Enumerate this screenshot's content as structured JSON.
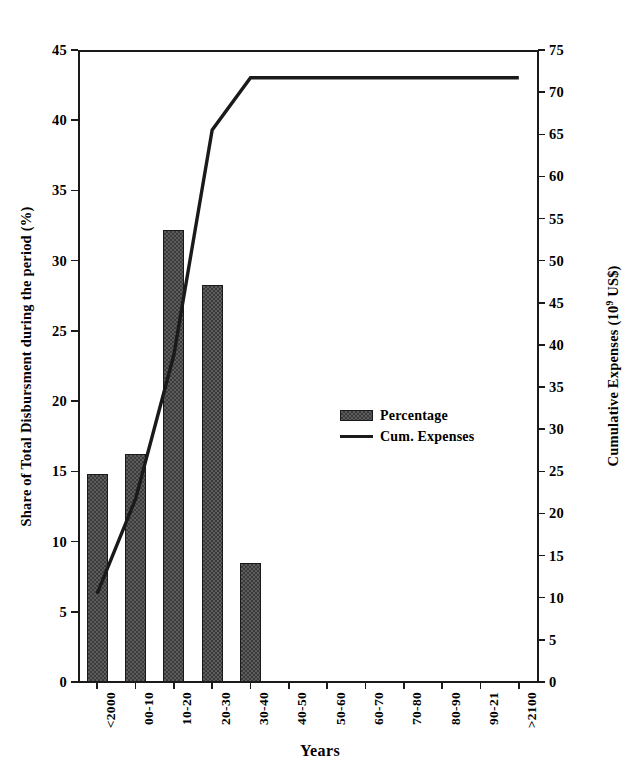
{
  "chart_data": {
    "type": "bar",
    "title": "",
    "xlabel": "Years",
    "ylabel": "Share of Total Disbursment during the period (%)",
    "y2label_text": "Cumulative Expenses (10",
    "y2label_sup": "9",
    "y2label_tail": " US$)",
    "categories": [
      "<2000",
      "00-10",
      "10-20",
      "20-30",
      "30-40",
      "40-50",
      "50-60",
      "60-70",
      "70-80",
      "80-90",
      "90-21",
      ">2100"
    ],
    "ylim": [
      0,
      45
    ],
    "yticks": [
      0,
      5,
      10,
      15,
      20,
      25,
      30,
      35,
      40,
      45
    ],
    "y2lim": [
      0,
      75
    ],
    "y2ticks": [
      0,
      5,
      10,
      15,
      20,
      25,
      30,
      35,
      40,
      45,
      50,
      55,
      60,
      65,
      70,
      75
    ],
    "grid": false,
    "legend_position": "center-right",
    "series": [
      {
        "name": "Percentage",
        "type": "bar",
        "axis": "left",
        "values": [
          14.8,
          16.2,
          32.2,
          28.3,
          8.5,
          0,
          0,
          0,
          0,
          0,
          0,
          0
        ]
      },
      {
        "name": "Cum. Expenses",
        "type": "line",
        "axis": "right",
        "values_left_axis": [
          6.3,
          13.0,
          23.3,
          39.3,
          43.0,
          43.0,
          43.0,
          43.0,
          43.0,
          43.0,
          43.0,
          43.0
        ],
        "values": [
          10.5,
          21.7,
          38.8,
          65.5,
          71.7,
          71.7,
          71.7,
          71.7,
          71.7,
          71.7,
          71.7,
          71.7
        ]
      }
    ],
    "legend": [
      "Percentage",
      "Cum. Expenses"
    ],
    "colors": {
      "bar_fill": "#5d5d5d",
      "bar_hatch": "#3a3a3a",
      "bar_edge": "#1a1a1a",
      "line": "#1a1a1a",
      "axis": "#1a1a1a",
      "background": "#ffffff"
    }
  }
}
